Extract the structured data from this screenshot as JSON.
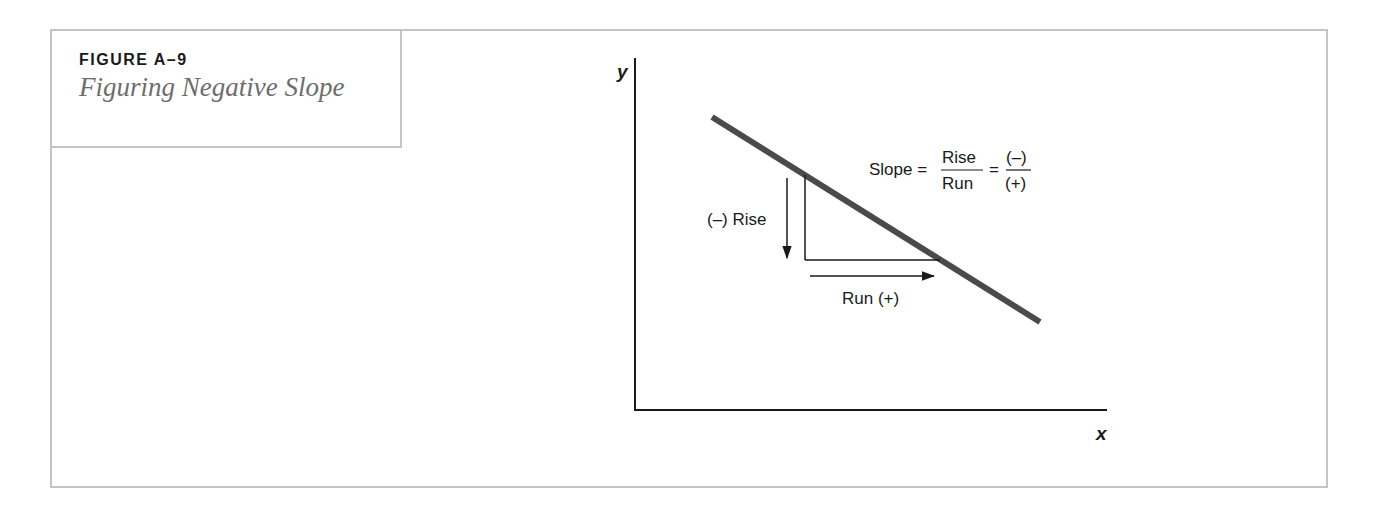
{
  "figure": {
    "label": "FIGURE A–9",
    "title": "Figuring Negative Slope"
  },
  "diagram": {
    "axes": {
      "x_label": "x",
      "y_label": "y"
    },
    "line": {
      "description": "downward sloping line",
      "color": "#4a4a4a"
    },
    "annotations": {
      "rise_label": "(–) Rise",
      "run_label": "Run (+)",
      "formula": {
        "lhs": "Slope =",
        "frac1_num": "Rise",
        "frac1_den": "Run",
        "equals": "=",
        "frac2_num": "(–)",
        "frac2_den": "(+)"
      }
    }
  },
  "colors": {
    "border": "#c4c4c4",
    "title_gray": "#6d6d6d",
    "ink": "#1a1a1a",
    "line": "#4a4a4a"
  }
}
